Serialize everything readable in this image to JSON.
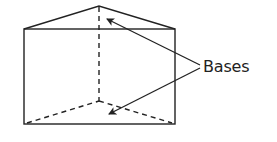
{
  "diagram": {
    "label": "Bases",
    "colors": {
      "stroke": "#222222",
      "background": "#ffffff"
    },
    "shapes": {
      "front_rect": {
        "x1": 24,
        "y1": 29,
        "x2": 175,
        "y2": 124
      },
      "top_apex": [
        99,
        6
      ],
      "back_bottom_vertex": [
        99,
        101
      ],
      "label_anchor": [
        200,
        66
      ],
      "arrow_tips": [
        [
          106,
          18
        ],
        [
          108,
          115
        ]
      ]
    },
    "callouts": [
      {
        "text": "Bases",
        "points_to": [
          "top triangular base",
          "bottom triangular base"
        ]
      }
    ]
  }
}
